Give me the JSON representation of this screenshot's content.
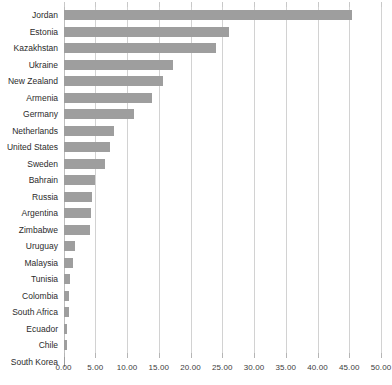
{
  "chart_data": {
    "type": "bar",
    "orientation": "horizontal",
    "title": "",
    "subtitle": "",
    "xlabel": "",
    "ylabel": "",
    "xlim": [
      0,
      50
    ],
    "xticks": [
      0,
      5,
      10,
      15,
      20,
      25,
      30,
      35,
      40,
      45,
      50
    ],
    "xtick_labels": [
      "0.00",
      "5.00",
      "10.00",
      "15.00",
      "20.00",
      "25.00",
      "30.00",
      "35.00",
      "40.00",
      "45.00",
      "50.00"
    ],
    "grid": true,
    "legend": false,
    "bar_color": "#9e9e9e",
    "gridline_color": "#d2d2d2",
    "categories": [
      "Jordan",
      "Estonia",
      "Kazakhstan",
      "Ukraine",
      "New Zealand",
      "Armenia",
      "Germany",
      "Netherlands",
      "United States",
      "Sweden",
      "Bahrain",
      "Russia",
      "Argentina",
      "Zimbabwe",
      "Uruguay",
      "Malaysia",
      "Tunisia",
      "Colombia",
      "South Africa",
      "Ecuador",
      "Chile",
      "South Korea"
    ],
    "values": [
      45.5,
      26.0,
      24.0,
      17.3,
      15.7,
      14.0,
      11.1,
      8.0,
      7.3,
      6.5,
      5.0,
      4.5,
      4.3,
      4.2,
      1.8,
      1.5,
      1.1,
      0.9,
      0.8,
      0.6,
      0.5,
      0.1
    ]
  }
}
